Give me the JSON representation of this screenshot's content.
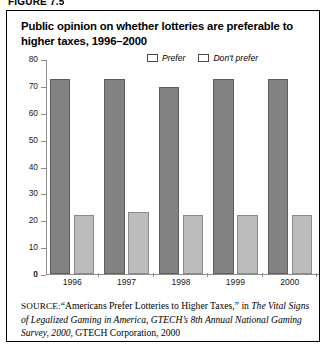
{
  "figure": {
    "label": "FIGURE 7.5"
  },
  "title": "Public opinion on whether lotteries are preferable to higher taxes, 1996–2000",
  "legend": {
    "position": "top-right",
    "items": [
      {
        "label": "Prefer",
        "color": "#828282",
        "name": "prefer"
      },
      {
        "label": "Don't prefer",
        "color": "#bcbcbc",
        "name": "dont-prefer"
      }
    ]
  },
  "source": {
    "prefix": "SOURCE:",
    "quote": "“Americans Prefer Lotteries to Higher Taxes,”",
    "connector": " in ",
    "italic_part": "The Vital Signs of Legalized Gaming in America, GTECH’s 8th Annual National Gaming Survey, 2000,",
    "tail": " GTECH Corporation, 2000"
  },
  "chart_data": {
    "type": "bar",
    "title": "Public opinion on whether lotteries are preferable to higher taxes, 1996–2000",
    "categories": [
      "1996",
      "1997",
      "1998",
      "1999",
      "2000"
    ],
    "series": [
      {
        "name": "Prefer",
        "values": [
          72.5,
          72.5,
          69.5,
          72.5,
          72.5
        ],
        "color": "#828282"
      },
      {
        "name": "Don't prefer",
        "values": [
          22,
          23,
          22,
          22,
          22
        ],
        "color": "#bcbcbc"
      }
    ],
    "xlabel": "",
    "ylabel": "",
    "ylim": [
      0,
      80
    ],
    "yticks": [
      0,
      10,
      20,
      30,
      40,
      50,
      60,
      70,
      80
    ],
    "ytick_labels": [
      "0",
      "10",
      "20",
      "30",
      "40",
      "50",
      "60",
      "70",
      "80"
    ],
    "grid": false,
    "legend_position": "top-right"
  }
}
